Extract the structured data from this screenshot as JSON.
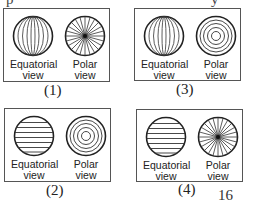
{
  "top_fragment": {
    "left": "p",
    "right": "y"
  },
  "panels": [
    {
      "id": "1",
      "caption": "(1)",
      "equatorial": {
        "label_line1": "Equatorial",
        "label_line2": "view",
        "pattern": "vertical-meridians"
      },
      "polar": {
        "label_line1": "Polar",
        "label_line2": "view",
        "pattern": "radial-spokes"
      }
    },
    {
      "id": "3",
      "caption": "(3)",
      "equatorial": {
        "label_line1": "Equatorial",
        "label_line2": "view",
        "pattern": "vertical-meridians"
      },
      "polar": {
        "label_line1": "Polar",
        "label_line2": "view",
        "pattern": "concentric-circles"
      }
    },
    {
      "id": "2",
      "caption": "(2)",
      "equatorial": {
        "label_line1": "Equatorial",
        "label_line2": "view",
        "pattern": "horizontal-latitudes"
      },
      "polar": {
        "label_line1": "Polar",
        "label_line2": "view",
        "pattern": "concentric-circles"
      }
    },
    {
      "id": "4",
      "caption": "(4)",
      "equatorial": {
        "label_line1": "Equatorial",
        "label_line2": "view",
        "pattern": "horizontal-latitudes"
      },
      "polar": {
        "label_line1": "Polar",
        "label_line2": "view",
        "pattern": "radial-spokes"
      }
    }
  ],
  "page_number": "16"
}
